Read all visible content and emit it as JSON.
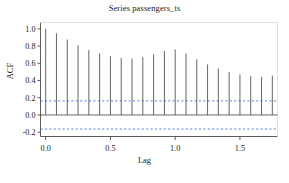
{
  "chart_data": {
    "type": "bar",
    "title": "Series passengers_ts",
    "xlabel": "Lag",
    "ylabel": "ACF",
    "xlim": [
      -0.04,
      1.79
    ],
    "ylim": [
      -0.25,
      1.05
    ],
    "xticks": [
      0.0,
      0.5,
      1.0,
      1.5
    ],
    "xticklabels": [
      "0.0",
      "0.5",
      "1.0",
      "1.5"
    ],
    "yticks": [
      -0.2,
      0.0,
      0.2,
      0.4,
      0.6,
      0.8,
      1.0
    ],
    "yticklabels": [
      "-0.2",
      "0.0",
      "0.2",
      "0.4",
      "0.6",
      "0.8",
      "1.0"
    ],
    "grid": false,
    "legend": null,
    "zero_line": 0.0,
    "confidence_bounds": [
      0.163,
      -0.163
    ],
    "confidence_line_style": "dashed",
    "confidence_line_color": "#3a5fcd",
    "bar_color": "#555555",
    "x": [
      0.0,
      0.0833,
      0.1667,
      0.25,
      0.3333,
      0.4167,
      0.5,
      0.5833,
      0.6667,
      0.75,
      0.8333,
      0.9167,
      1.0,
      1.0833,
      1.1667,
      1.25,
      1.3333,
      1.4167,
      1.5,
      1.5833,
      1.6667,
      1.75
    ],
    "values": [
      1.0,
      0.948,
      0.876,
      0.807,
      0.753,
      0.714,
      0.682,
      0.663,
      0.656,
      0.671,
      0.703,
      0.743,
      0.76,
      0.713,
      0.646,
      0.586,
      0.538,
      0.5,
      0.469,
      0.45,
      0.442,
      0.457
    ],
    "categories": [
      "0",
      "1",
      "2",
      "3",
      "4",
      "5",
      "6",
      "7",
      "8",
      "9",
      "10",
      "11",
      "12",
      "13",
      "14",
      "15",
      "16",
      "17",
      "18",
      "19",
      "20",
      "21"
    ]
  }
}
